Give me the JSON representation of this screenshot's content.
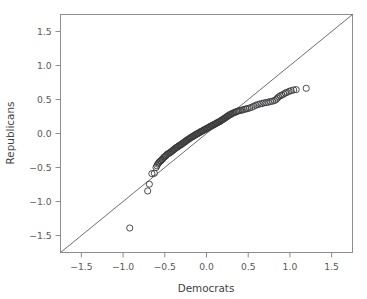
{
  "chart_data": {
    "type": "scatter",
    "title": "",
    "xlabel": "Democrats",
    "ylabel": "Republicans",
    "xlim": [
      -1.75,
      1.75
    ],
    "ylim": [
      -1.75,
      1.75
    ],
    "grid": false,
    "legend": null,
    "xticks": [
      "-1.5",
      "-1.0",
      "-0.5",
      "0.0",
      "0.5",
      "1.0",
      "1.5"
    ],
    "xtick_values": [
      -1.5,
      -1.0,
      -0.5,
      0.0,
      0.5,
      1.0,
      1.5
    ],
    "yticks": [
      "1.5",
      "1.0",
      "0.5",
      "0.0",
      "-0.5",
      "-1.0",
      "-1.5"
    ],
    "ytick_values": [
      1.5,
      1.0,
      0.5,
      0.0,
      -0.5,
      -1.0,
      -1.5
    ],
    "marker": "open-circle",
    "marker_size": 3.1,
    "point_color": "#3a3a3c",
    "reference_line": {
      "type": "identity",
      "from": [
        -1.75,
        -1.75
      ],
      "to": [
        1.75,
        1.75
      ],
      "color": "#5d5d60"
    },
    "annotations": [
      {
        "text": "low outlier",
        "x": -0.92,
        "y": -1.39
      }
    ],
    "series": [
      {
        "name": "quantile-pairs",
        "points": [
          [
            -0.92,
            -1.39
          ],
          [
            -0.705,
            -0.845
          ],
          [
            -0.685,
            -0.745
          ],
          [
            -0.655,
            -0.59
          ],
          [
            -0.625,
            -0.585
          ],
          [
            -0.605,
            -0.5
          ],
          [
            -0.595,
            -0.475
          ],
          [
            -0.585,
            -0.45
          ],
          [
            -0.575,
            -0.435
          ],
          [
            -0.565,
            -0.42
          ],
          [
            -0.555,
            -0.405
          ],
          [
            -0.545,
            -0.4
          ],
          [
            -0.535,
            -0.385
          ],
          [
            -0.525,
            -0.375
          ],
          [
            -0.515,
            -0.355
          ],
          [
            -0.505,
            -0.345
          ],
          [
            -0.495,
            -0.335
          ],
          [
            -0.485,
            -0.325
          ],
          [
            -0.475,
            -0.31
          ],
          [
            -0.465,
            -0.3
          ],
          [
            -0.45,
            -0.29
          ],
          [
            -0.44,
            -0.285
          ],
          [
            -0.43,
            -0.275
          ],
          [
            -0.42,
            -0.265
          ],
          [
            -0.41,
            -0.255
          ],
          [
            -0.4,
            -0.245
          ],
          [
            -0.39,
            -0.235
          ],
          [
            -0.38,
            -0.225
          ],
          [
            -0.37,
            -0.215
          ],
          [
            -0.36,
            -0.205
          ],
          [
            -0.35,
            -0.2
          ],
          [
            -0.34,
            -0.19
          ],
          [
            -0.33,
            -0.18
          ],
          [
            -0.32,
            -0.175
          ],
          [
            -0.31,
            -0.165
          ],
          [
            -0.3,
            -0.16
          ],
          [
            -0.29,
            -0.15
          ],
          [
            -0.28,
            -0.14
          ],
          [
            -0.27,
            -0.13
          ],
          [
            -0.26,
            -0.125
          ],
          [
            -0.25,
            -0.115
          ],
          [
            -0.245,
            -0.105
          ],
          [
            -0.235,
            -0.1
          ],
          [
            -0.225,
            -0.09
          ],
          [
            -0.215,
            -0.085
          ],
          [
            -0.205,
            -0.075
          ],
          [
            -0.195,
            -0.065
          ],
          [
            -0.185,
            -0.06
          ],
          [
            -0.175,
            -0.05
          ],
          [
            -0.165,
            -0.045
          ],
          [
            -0.155,
            -0.035
          ],
          [
            -0.145,
            -0.03
          ],
          [
            -0.135,
            -0.02
          ],
          [
            -0.125,
            -0.015
          ],
          [
            -0.115,
            -0.005
          ],
          [
            -0.105,
            0.0
          ],
          [
            -0.095,
            0.005
          ],
          [
            -0.085,
            0.015
          ],
          [
            -0.075,
            0.02
          ],
          [
            -0.065,
            0.03
          ],
          [
            -0.055,
            0.035
          ],
          [
            -0.045,
            0.04
          ],
          [
            -0.035,
            0.05
          ],
          [
            -0.025,
            0.055
          ],
          [
            -0.015,
            0.06
          ],
          [
            -0.005,
            0.07
          ],
          [
            0.005,
            0.075
          ],
          [
            0.015,
            0.08
          ],
          [
            0.025,
            0.09
          ],
          [
            0.035,
            0.095
          ],
          [
            0.045,
            0.1
          ],
          [
            0.055,
            0.11
          ],
          [
            0.065,
            0.115
          ],
          [
            0.075,
            0.12
          ],
          [
            0.085,
            0.13
          ],
          [
            0.095,
            0.135
          ],
          [
            0.105,
            0.14
          ],
          [
            0.115,
            0.15
          ],
          [
            0.125,
            0.155
          ],
          [
            0.135,
            0.16
          ],
          [
            0.145,
            0.17
          ],
          [
            0.155,
            0.175
          ],
          [
            0.165,
            0.18
          ],
          [
            0.175,
            0.19
          ],
          [
            0.185,
            0.2
          ],
          [
            0.195,
            0.205
          ],
          [
            0.205,
            0.215
          ],
          [
            0.215,
            0.22
          ],
          [
            0.225,
            0.23
          ],
          [
            0.235,
            0.24
          ],
          [
            0.245,
            0.25
          ],
          [
            0.255,
            0.255
          ],
          [
            0.265,
            0.265
          ],
          [
            0.275,
            0.275
          ],
          [
            0.29,
            0.28
          ],
          [
            0.3,
            0.29
          ],
          [
            0.315,
            0.3
          ],
          [
            0.33,
            0.305
          ],
          [
            0.345,
            0.315
          ],
          [
            0.36,
            0.32
          ],
          [
            0.375,
            0.33
          ],
          [
            0.39,
            0.335
          ],
          [
            0.41,
            0.34
          ],
          [
            0.43,
            0.345
          ],
          [
            0.45,
            0.355
          ],
          [
            0.47,
            0.36
          ],
          [
            0.49,
            0.365
          ],
          [
            0.515,
            0.375
          ],
          [
            0.54,
            0.385
          ],
          [
            0.565,
            0.4
          ],
          [
            0.59,
            0.415
          ],
          [
            0.615,
            0.425
          ],
          [
            0.64,
            0.435
          ],
          [
            0.665,
            0.44
          ],
          [
            0.69,
            0.45
          ],
          [
            0.715,
            0.455
          ],
          [
            0.74,
            0.46
          ],
          [
            0.765,
            0.47
          ],
          [
            0.79,
            0.475
          ],
          [
            0.815,
            0.485
          ],
          [
            0.835,
            0.5
          ],
          [
            0.85,
            0.52
          ],
          [
            0.865,
            0.54
          ],
          [
            0.885,
            0.555
          ],
          [
            0.905,
            0.565
          ],
          [
            0.925,
            0.58
          ],
          [
            0.945,
            0.595
          ],
          [
            0.965,
            0.605
          ],
          [
            0.99,
            0.62
          ],
          [
            1.015,
            0.63
          ],
          [
            1.045,
            0.64
          ],
          [
            1.075,
            0.645
          ],
          [
            1.195,
            0.665
          ]
        ]
      }
    ]
  },
  "axes": {
    "x_title": "Democrats",
    "y_title": "Republicans"
  }
}
